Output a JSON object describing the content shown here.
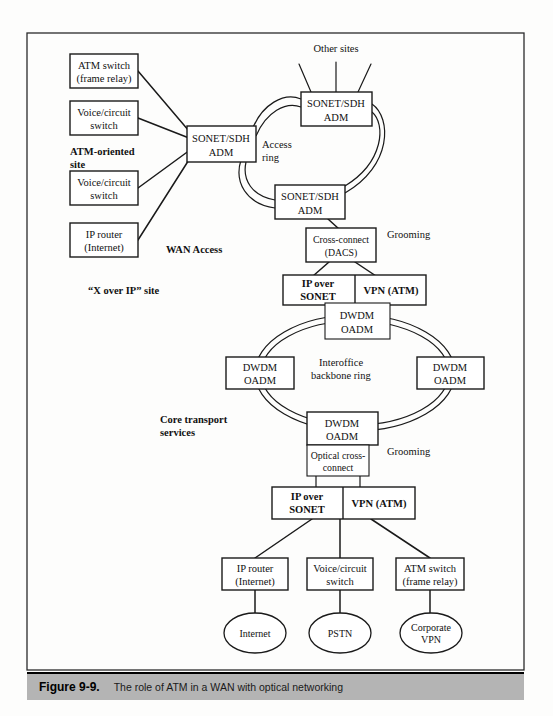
{
  "figure": {
    "caption_number": "Figure 9-9.",
    "caption_text": "The role of ATM in a WAN with optical networking"
  },
  "section_labels": {
    "atm_site": "ATM-oriented",
    "atm_site_line2": "site",
    "wan_access": "WAN Access",
    "x_over_ip": "“X over IP” site",
    "core_transport": "Core transport",
    "core_transport_line2": "services"
  },
  "annotations": {
    "other_sites": "Other sites",
    "access_ring_line1": "Access",
    "access_ring_line2": "ring",
    "grooming_top": "Grooming",
    "grooming_bottom": "Grooming",
    "backbone_ring_line1": "Interoffice",
    "backbone_ring_line2": "backbone ring"
  },
  "access_nodes": [
    {
      "id": "atm-switch-top",
      "line1": "ATM switch",
      "line2": "(frame relay)"
    },
    {
      "id": "voice-switch-top",
      "line1": "Voice/circuit",
      "line2": "switch"
    },
    {
      "id": "voice-switch-bottom",
      "line1": "Voice/circuit",
      "line2": "switch"
    },
    {
      "id": "ip-router-top",
      "line1": "IP router",
      "line2": "(Internet)"
    }
  ],
  "ring_nodes": [
    {
      "id": "adm-hub",
      "line1": "SONET/SDH",
      "line2": "ADM"
    },
    {
      "id": "adm-top",
      "line1": "SONET/SDH",
      "line2": "ADM"
    },
    {
      "id": "adm-lower",
      "line1": "SONET/SDH",
      "line2": "ADM"
    }
  ],
  "cross_connect": {
    "line1": "Cross-connect",
    "line2": "(DACS)"
  },
  "service_pair_top": {
    "left_line1": "IP over",
    "left_line2": "SONET",
    "right": "VPN (ATM)"
  },
  "service_pair_bottom": {
    "left_line1": "IP over",
    "left_line2": "SONET",
    "right": "VPN (ATM)"
  },
  "dwdm_nodes": [
    {
      "id": "dwdm-top",
      "line1": "DWDM",
      "line2": "OADM"
    },
    {
      "id": "dwdm-left",
      "line1": "DWDM",
      "line2": "OADM"
    },
    {
      "id": "dwdm-right",
      "line1": "DWDM",
      "line2": "OADM"
    },
    {
      "id": "dwdm-bottom",
      "line1": "DWDM",
      "line2": "OADM"
    }
  ],
  "optical_cross_connect": {
    "line1": "Optical cross-",
    "line2": "connect"
  },
  "edge_nodes": [
    {
      "id": "ip-router-bottom",
      "line1": "IP router",
      "line2": "(Internet)"
    },
    {
      "id": "voice-switch-edge",
      "line1": "Voice/circuit",
      "line2": "switch"
    },
    {
      "id": "atm-switch-bottom",
      "line1": "ATM switch",
      "line2": "(frame relay)"
    }
  ],
  "cloud_nodes": [
    {
      "id": "internet-cloud",
      "label": "Internet"
    },
    {
      "id": "pstn-cloud",
      "label": "PSTN"
    },
    {
      "id": "corporate-vpn-cloud",
      "line1": "Corporate",
      "line2": "VPN"
    }
  ],
  "colors": {
    "line": "#1a1a1a",
    "caption_bar": "#b4b4b4",
    "page_bg": "#fdfdfc"
  }
}
